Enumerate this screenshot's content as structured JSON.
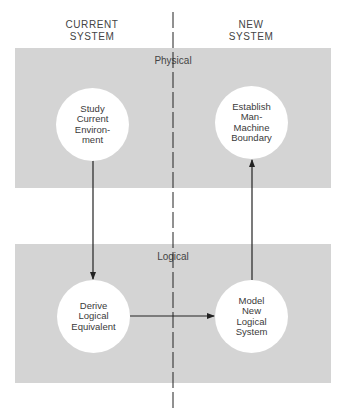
{
  "headers": {
    "current": "CURRENT\nSYSTEM",
    "new": "NEW\nSYSTEM"
  },
  "bands": {
    "physical": {
      "label": "Physical",
      "color": "#d4d4d4"
    },
    "logical": {
      "label": "Logical",
      "color": "#d4d4d4"
    }
  },
  "nodes": {
    "study": "Study\nCurrent\nEnviron-\nment",
    "establish": "Establish\nMan-\nMachine\nBoundary",
    "derive": "Derive\nLogical\nEquivalent",
    "model": "Model\nNew\nLogical\nSystem"
  },
  "edges": [
    {
      "from": "Study Current Environment",
      "to": "Derive Logical Equivalent"
    },
    {
      "from": "Derive Logical Equivalent",
      "to": "Model New Logical System"
    },
    {
      "from": "Model New Logical System",
      "to": "Establish Man-Machine Boundary"
    }
  ]
}
